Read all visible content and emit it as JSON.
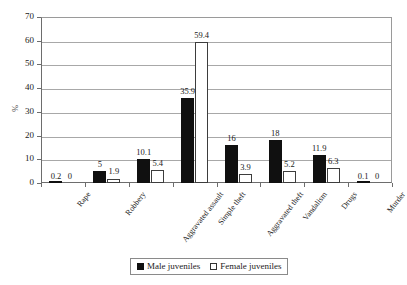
{
  "chart_data": {
    "type": "bar",
    "title": "",
    "xlabel": "",
    "ylabel": "%",
    "ylim": [
      0,
      70
    ],
    "ytick_step": 10,
    "yticks": [
      0,
      10,
      20,
      30,
      40,
      50,
      60,
      70
    ],
    "grid": true,
    "legend_position": "bottom",
    "categories": [
      "Rape",
      "Robbery",
      "Aggravated assault",
      "Simple theft",
      "Aggravated theft",
      "Vandalism",
      "Drugs",
      "Murder"
    ],
    "series": [
      {
        "name": "Male juveniles",
        "color": "#101010",
        "values": [
          0.2,
          5,
          10.1,
          35.9,
          16,
          18,
          11.9,
          0.1
        ],
        "labels": [
          "0.2",
          "5",
          "10.1",
          "35.9",
          "16",
          "18",
          "11.9",
          "0.1"
        ]
      },
      {
        "name": "Female juveniles",
        "color": "#ffffff",
        "values": [
          0,
          1.9,
          5.4,
          59.4,
          3.9,
          5.2,
          6.3,
          0
        ],
        "labels": [
          "0",
          "1.9",
          "5.4",
          "59.4",
          "3.9",
          "5.2",
          "6.3",
          "0"
        ]
      }
    ]
  },
  "axis": {
    "y_title": "%",
    "y_tick_labels": [
      "0",
      "10",
      "20",
      "30",
      "40",
      "50",
      "60",
      "70"
    ]
  },
  "legend": {
    "items": [
      {
        "label": "Male juveniles",
        "swatch": "male"
      },
      {
        "label": "Female juveniles",
        "swatch": "female"
      }
    ]
  }
}
